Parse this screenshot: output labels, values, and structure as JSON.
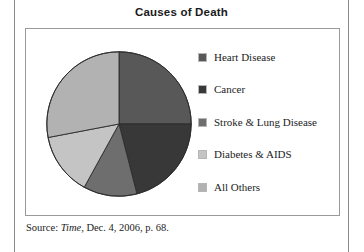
{
  "chart_data": {
    "type": "pie",
    "title": "Causes of Death",
    "categories": [
      "Heart Disease",
      "Cancer",
      "Stroke & Lung Disease",
      "Diabetes & AIDS",
      "All Others"
    ],
    "values": [
      25,
      21,
      12,
      14,
      28
    ],
    "colors": [
      "#585858",
      "#383838",
      "#6e6e6e",
      "#c4c4c4",
      "#b2b2b2"
    ],
    "legend_position": "right",
    "grid": false,
    "start_angle_deg": 0,
    "direction": "clockwise",
    "xlabel": "",
    "ylabel": ""
  },
  "header": {
    "title": "Causes of Death"
  },
  "legend": {
    "items": [
      {
        "label": "Heart Disease",
        "color": "#585858"
      },
      {
        "label": "Cancer",
        "color": "#383838"
      },
      {
        "label": "Stroke & Lung Disease",
        "color": "#6e6e6e"
      },
      {
        "label": "Diabetes & AIDS",
        "color": "#c4c4c4"
      },
      {
        "label": "All Others",
        "color": "#b2b2b2"
      }
    ]
  },
  "source": {
    "prefix": "Source: ",
    "publication": "Time",
    "suffix": ", Dec. 4, 2006, p. 68."
  }
}
